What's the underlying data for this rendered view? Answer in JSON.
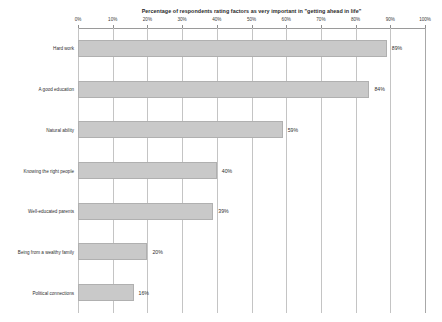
{
  "chart_data": {
    "type": "bar",
    "orientation": "horizontal",
    "title": "Percentage of respondents rating factors as very important in \"getting ahead in life\"",
    "xlabel": "",
    "ylabel": "",
    "xlim": [
      0,
      100
    ],
    "grid": true,
    "legend": "none",
    "xtick_labels": [
      "0%",
      "10%",
      "20%",
      "30%",
      "40%",
      "50%",
      "60%",
      "70%",
      "80%",
      "90%",
      "100%"
    ],
    "xticks": [
      0,
      10,
      20,
      30,
      40,
      50,
      60,
      70,
      80,
      90,
      100
    ],
    "categories": [
      "Hard work",
      "A good education",
      "Natural ability",
      "Knowing the right people",
      "Well-educated parents",
      "Being from a wealthy family",
      "Political connections"
    ],
    "values": [
      89,
      84,
      59,
      40,
      39,
      20,
      16
    ],
    "value_labels": [
      "89%",
      "84%",
      "59%",
      "40%",
      "39%",
      "20%",
      "16%"
    ],
    "bar_color": "#c9c9c9",
    "bar_border_color": "#b0b0b0",
    "gridline_color": "#c4c4c4",
    "axis_color": "#9a9a9a",
    "text_color": "#2f2f2f",
    "background_color": "#ffffff"
  }
}
